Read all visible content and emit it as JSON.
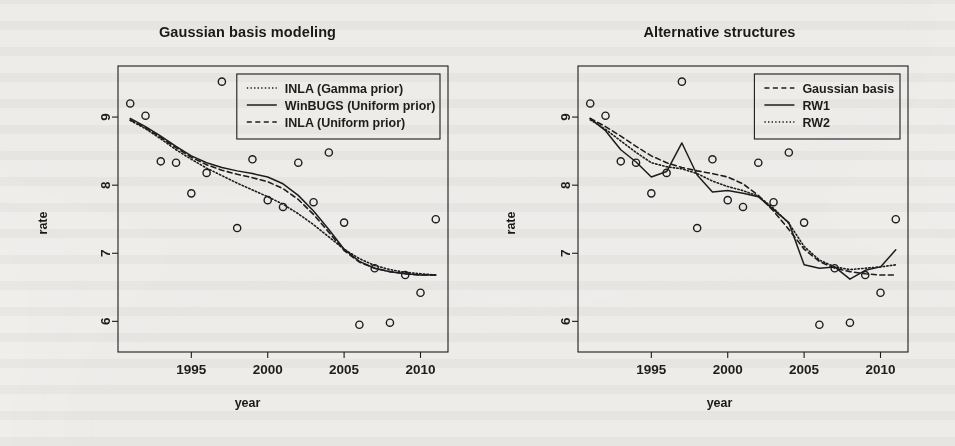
{
  "figure": {
    "background_color": "#f4f3f1",
    "ink_color": "#1d1d1d"
  },
  "panels": [
    {
      "id": "gaussian-basis-modeling",
      "title": "Gaussian basis modeling",
      "xlabel": "year",
      "ylabel": "rate"
    },
    {
      "id": "alternative-structures",
      "title": "Alternative structures",
      "xlabel": "year",
      "ylabel": "rate"
    }
  ],
  "chart_data": [
    {
      "type": "scatter",
      "title": "Gaussian basis modeling",
      "xlabel": "year",
      "ylabel": "rate",
      "xlim": [
        1990.2,
        2011.8
      ],
      "ylim": [
        5.55,
        9.75
      ],
      "xticks": [
        1995,
        2000,
        2005,
        2010
      ],
      "yticks": [
        6,
        7,
        8,
        9
      ],
      "grid": false,
      "legend_position": "top-right",
      "points": {
        "name": "observed rate",
        "marker": "open-circle",
        "x": [
          1991,
          1992,
          1993,
          1994,
          1995,
          1996,
          1997,
          1998,
          1999,
          2000,
          2001,
          2002,
          2003,
          2004,
          2005,
          2006,
          2007,
          2008,
          2009,
          2010,
          2011
        ],
        "y": [
          9.2,
          9.02,
          8.35,
          8.33,
          7.88,
          8.18,
          9.52,
          7.37,
          8.38,
          7.78,
          7.68,
          8.33,
          7.75,
          8.48,
          7.45,
          5.95,
          6.78,
          5.98,
          6.68,
          6.42,
          7.5
        ]
      },
      "series": [
        {
          "name": "INLA (Gamma prior)",
          "style": "dotted",
          "x": [
            1991,
            1992,
            1993,
            1994,
            1995,
            1996,
            1997,
            1998,
            1999,
            2000,
            2001,
            2002,
            2003,
            2004,
            2005,
            2006,
            2007,
            2008,
            2009,
            2010,
            2011
          ],
          "y": [
            8.95,
            8.83,
            8.68,
            8.52,
            8.38,
            8.25,
            8.14,
            8.03,
            7.93,
            7.83,
            7.72,
            7.58,
            7.42,
            7.24,
            7.06,
            6.92,
            6.82,
            6.76,
            6.72,
            6.7,
            6.68
          ]
        },
        {
          "name": "WinBUGS (Uniform prior)",
          "style": "solid",
          "x": [
            1991,
            1992,
            1993,
            1994,
            1995,
            1996,
            1997,
            1998,
            1999,
            2000,
            2001,
            2002,
            2003,
            2004,
            2005,
            2006,
            2007,
            2008,
            2009,
            2010,
            2011
          ],
          "y": [
            8.98,
            8.86,
            8.72,
            8.57,
            8.43,
            8.33,
            8.26,
            8.21,
            8.17,
            8.12,
            8.02,
            7.85,
            7.62,
            7.35,
            7.06,
            6.88,
            6.78,
            6.73,
            6.7,
            6.68,
            6.68
          ]
        },
        {
          "name": "INLA (Uniform prior)",
          "style": "dashed",
          "x": [
            1991,
            1992,
            1993,
            1994,
            1995,
            1996,
            1997,
            1998,
            1999,
            2000,
            2001,
            2002,
            2003,
            2004,
            2005,
            2006,
            2007,
            2008,
            2009,
            2010,
            2011
          ],
          "y": [
            8.96,
            8.84,
            8.7,
            8.55,
            8.41,
            8.3,
            8.22,
            8.16,
            8.11,
            8.05,
            7.95,
            7.79,
            7.57,
            7.31,
            7.04,
            6.87,
            6.78,
            6.73,
            6.7,
            6.68,
            6.68
          ]
        }
      ],
      "legend": [
        {
          "label": "INLA (Gamma prior)",
          "style": "dotted"
        },
        {
          "label": "WinBUGS (Uniform prior)",
          "style": "solid"
        },
        {
          "label": "INLA (Uniform prior)",
          "style": "dashed"
        }
      ]
    },
    {
      "type": "scatter",
      "title": "Alternative structures",
      "xlabel": "year",
      "ylabel": "rate",
      "xlim": [
        1990.2,
        2011.8
      ],
      "ylim": [
        5.55,
        9.75
      ],
      "xticks": [
        1995,
        2000,
        2005,
        2010
      ],
      "yticks": [
        6,
        7,
        8,
        9
      ],
      "grid": false,
      "legend_position": "top-right",
      "points": {
        "name": "observed rate",
        "marker": "open-circle",
        "x": [
          1991,
          1992,
          1993,
          1994,
          1995,
          1996,
          1997,
          1998,
          1999,
          2000,
          2001,
          2002,
          2003,
          2004,
          2005,
          2006,
          2007,
          2008,
          2009,
          2010,
          2011
        ],
        "y": [
          9.2,
          9.02,
          8.35,
          8.33,
          7.88,
          8.18,
          9.52,
          7.37,
          8.38,
          7.78,
          7.68,
          8.33,
          7.75,
          8.48,
          7.45,
          5.95,
          6.78,
          5.98,
          6.68,
          6.42,
          7.5
        ]
      },
      "series": [
        {
          "name": "Gaussian basis",
          "style": "dashed",
          "x": [
            1991,
            1992,
            1993,
            1994,
            1995,
            1996,
            1997,
            1998,
            1999,
            2000,
            2001,
            2002,
            2003,
            2004,
            2005,
            2006,
            2007,
            2008,
            2009,
            2010,
            2011
          ],
          "y": [
            8.98,
            8.86,
            8.72,
            8.57,
            8.43,
            8.33,
            8.26,
            8.21,
            8.17,
            8.12,
            8.02,
            7.85,
            7.62,
            7.35,
            7.06,
            6.88,
            6.78,
            6.73,
            6.7,
            6.68,
            6.68
          ]
        },
        {
          "name": "RW1",
          "style": "solid",
          "x": [
            1991,
            1992,
            1993,
            1994,
            1995,
            1996,
            1997,
            1998,
            1999,
            2000,
            2001,
            2002,
            2003,
            2004,
            2005,
            2006,
            2007,
            2008,
            2009,
            2010,
            2011
          ],
          "y": [
            8.98,
            8.8,
            8.52,
            8.34,
            8.12,
            8.2,
            8.62,
            8.15,
            7.9,
            7.92,
            7.88,
            7.83,
            7.64,
            7.45,
            6.83,
            6.78,
            6.8,
            6.62,
            6.75,
            6.8,
            7.05
          ]
        },
        {
          "name": "RW2",
          "style": "dotted",
          "x": [
            1991,
            1992,
            1993,
            1994,
            1995,
            1996,
            1997,
            1998,
            1999,
            2000,
            2001,
            2002,
            2003,
            2004,
            2005,
            2006,
            2007,
            2008,
            2009,
            2010,
            2011
          ],
          "y": [
            8.96,
            8.82,
            8.65,
            8.48,
            8.33,
            8.27,
            8.24,
            8.17,
            8.06,
            7.98,
            7.92,
            7.84,
            7.66,
            7.44,
            7.1,
            6.9,
            6.8,
            6.76,
            6.78,
            6.8,
            6.83
          ]
        }
      ],
      "legend": [
        {
          "label": "Gaussian basis",
          "style": "dashed"
        },
        {
          "label": "RW1",
          "style": "solid"
        },
        {
          "label": "RW2",
          "style": "dotted"
        }
      ]
    }
  ]
}
